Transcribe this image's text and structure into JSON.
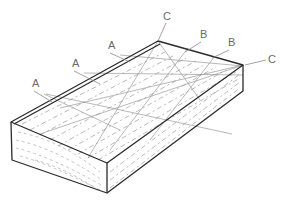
{
  "diagram": {
    "labels": [
      {
        "id": "a1",
        "text": "A",
        "x": 32,
        "y": 87
      },
      {
        "id": "a2",
        "text": "A",
        "x": 72,
        "y": 67
      },
      {
        "id": "a3",
        "text": "A",
        "x": 108,
        "y": 49
      },
      {
        "id": "c1",
        "text": "C",
        "x": 163,
        "y": 20
      },
      {
        "id": "b1",
        "text": "B",
        "x": 200,
        "y": 38
      },
      {
        "id": "b2",
        "text": "B",
        "x": 228,
        "y": 46
      },
      {
        "id": "c2",
        "text": "C",
        "x": 268,
        "y": 63
      }
    ],
    "colors": {
      "outline": "#2b2b2b",
      "leader": "#8c8c8c",
      "label": "#6a6a6a",
      "background": "#ffffff"
    }
  }
}
